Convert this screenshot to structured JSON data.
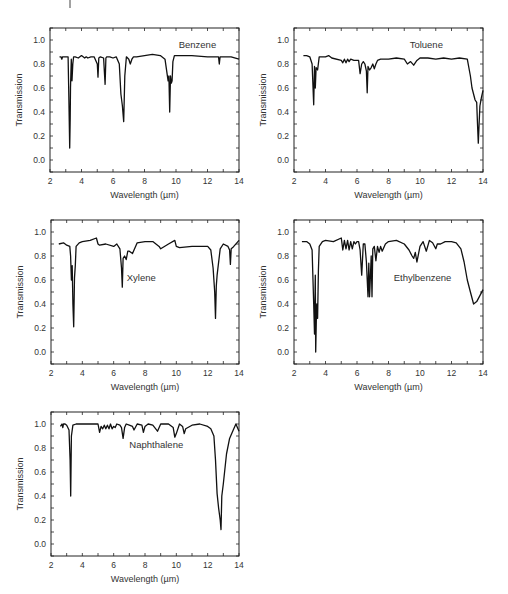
{
  "chart_data": [
    {
      "type": "line",
      "title": "Benzene",
      "xlabel": "Wavelength (µm)",
      "ylabel": "Transmission",
      "xlim": [
        2,
        14
      ],
      "ylim": [
        -0.1,
        1.1
      ],
      "xticks": [
        2,
        4,
        6,
        8,
        10,
        12,
        14
      ],
      "yticks": [
        "0.0",
        "0.2",
        "0.4",
        "0.6",
        "0.8",
        "1.0"
      ],
      "grid": false,
      "label_pos": [
        0.78,
        0.88
      ],
      "x": [
        2.6,
        2.7,
        2.75,
        2.8,
        3.0,
        3.15,
        3.2,
        3.25,
        3.28,
        3.3,
        3.35,
        3.4,
        3.45,
        3.5,
        3.6,
        3.8,
        4.0,
        4.2,
        4.3,
        4.4,
        4.6,
        4.8,
        5.0,
        5.05,
        5.1,
        5.2,
        5.4,
        5.5,
        5.55,
        5.6,
        5.8,
        6.0,
        6.2,
        6.4,
        6.5,
        6.6,
        6.68,
        6.75,
        6.85,
        7.0,
        7.1,
        7.2,
        7.3,
        7.5,
        8.0,
        8.5,
        9.0,
        9.3,
        9.5,
        9.55,
        9.6,
        9.65,
        9.7,
        9.75,
        9.8,
        9.9,
        10.0,
        10.5,
        11.0,
        12.0,
        12.7,
        12.75,
        12.8,
        12.85,
        13.0,
        13.5,
        14.0
      ],
      "y": [
        0.86,
        0.86,
        0.84,
        0.86,
        0.86,
        0.86,
        0.5,
        0.1,
        0.35,
        0.6,
        0.84,
        0.66,
        0.8,
        0.86,
        0.86,
        0.85,
        0.87,
        0.85,
        0.86,
        0.85,
        0.86,
        0.86,
        0.8,
        0.69,
        0.85,
        0.86,
        0.85,
        0.63,
        0.85,
        0.86,
        0.86,
        0.85,
        0.86,
        0.8,
        0.55,
        0.45,
        0.32,
        0.7,
        0.86,
        0.84,
        0.8,
        0.84,
        0.86,
        0.86,
        0.87,
        0.88,
        0.87,
        0.84,
        0.66,
        0.7,
        0.4,
        0.7,
        0.64,
        0.66,
        0.82,
        0.87,
        0.87,
        0.87,
        0.87,
        0.86,
        0.86,
        0.8,
        0.86,
        0.86,
        0.86,
        0.86,
        0.84
      ]
    },
    {
      "type": "line",
      "title": "Toluene",
      "xlabel": "Wavelength (µm)",
      "ylabel": "Transmission",
      "xlim": [
        2,
        14
      ],
      "ylim": [
        -0.1,
        1.1
      ],
      "xticks": [
        2,
        4,
        6,
        8,
        10,
        12,
        14
      ],
      "yticks": [
        "0.0",
        "0.2",
        "0.4",
        "0.6",
        "0.8",
        "1.0"
      ],
      "grid": false,
      "label_pos": [
        0.7,
        0.88
      ],
      "x": [
        2.6,
        2.8,
        3.0,
        3.15,
        3.25,
        3.3,
        3.35,
        3.4,
        3.5,
        3.6,
        4.0,
        4.2,
        4.4,
        5.0,
        5.1,
        5.2,
        5.3,
        5.4,
        5.5,
        5.6,
        5.8,
        6.0,
        6.1,
        6.2,
        6.3,
        6.4,
        6.5,
        6.6,
        6.65,
        6.7,
        6.8,
        6.9,
        7.0,
        7.1,
        7.2,
        7.3,
        7.5,
        8.0,
        8.5,
        9.0,
        9.2,
        9.4,
        9.6,
        9.8,
        10.0,
        10.5,
        11.0,
        11.5,
        12.0,
        12.5,
        13.0,
        13.2,
        13.3,
        13.5,
        13.6,
        13.65,
        13.7,
        13.75,
        13.8,
        13.9,
        14.0
      ],
      "y": [
        0.87,
        0.87,
        0.86,
        0.8,
        0.46,
        0.78,
        0.6,
        0.77,
        0.75,
        0.86,
        0.86,
        0.87,
        0.85,
        0.83,
        0.81,
        0.84,
        0.81,
        0.84,
        0.82,
        0.84,
        0.83,
        0.83,
        0.83,
        0.72,
        0.8,
        0.82,
        0.8,
        0.74,
        0.56,
        0.78,
        0.75,
        0.77,
        0.8,
        0.76,
        0.8,
        0.83,
        0.84,
        0.84,
        0.85,
        0.84,
        0.8,
        0.82,
        0.79,
        0.83,
        0.85,
        0.85,
        0.84,
        0.85,
        0.84,
        0.85,
        0.84,
        0.7,
        0.6,
        0.5,
        0.48,
        0.3,
        0.14,
        0.3,
        0.45,
        0.52,
        0.58
      ]
    },
    {
      "type": "line",
      "title": "Xylene",
      "xlabel": "Wavelength (µm)",
      "ylabel": "Transmission",
      "xlim": [
        2,
        14
      ],
      "ylim": [
        -0.1,
        1.1
      ],
      "xticks": [
        2,
        4,
        6,
        8,
        10,
        12,
        14
      ],
      "yticks": [
        "0.0",
        "0.2",
        "0.4",
        "0.6",
        "0.8",
        "1.0"
      ],
      "grid": false,
      "label_pos": [
        0.48,
        0.6
      ],
      "x": [
        2.5,
        2.8,
        3.0,
        3.2,
        3.25,
        3.3,
        3.35,
        3.4,
        3.45,
        3.5,
        3.55,
        3.6,
        3.8,
        4.0,
        4.5,
        4.9,
        5.0,
        5.1,
        5.5,
        6.0,
        6.2,
        6.4,
        6.5,
        6.55,
        6.6,
        6.7,
        6.8,
        6.9,
        7.0,
        7.2,
        7.5,
        8.0,
        8.5,
        8.9,
        9.0,
        9.5,
        9.9,
        10.0,
        10.2,
        11.0,
        12.0,
        12.2,
        12.35,
        12.45,
        12.5,
        12.55,
        12.6,
        12.8,
        13.0,
        13.3,
        13.4,
        13.45,
        13.5,
        13.6,
        14.0
      ],
      "y": [
        0.9,
        0.91,
        0.89,
        0.88,
        0.8,
        0.6,
        0.72,
        0.4,
        0.21,
        0.62,
        0.72,
        0.88,
        0.91,
        0.92,
        0.93,
        0.95,
        0.9,
        0.89,
        0.9,
        0.88,
        0.9,
        0.86,
        0.7,
        0.54,
        0.78,
        0.8,
        0.77,
        0.84,
        0.84,
        0.82,
        0.91,
        0.92,
        0.92,
        0.88,
        0.86,
        0.9,
        0.93,
        0.88,
        0.87,
        0.88,
        0.88,
        0.85,
        0.7,
        0.5,
        0.28,
        0.55,
        0.64,
        0.86,
        0.9,
        0.88,
        0.85,
        0.73,
        0.86,
        0.87,
        0.93
      ]
    },
    {
      "type": "line",
      "title": "Ethylbenzene",
      "xlabel": "Wavelength (µm)",
      "ylabel": "Transmission",
      "xlim": [
        2,
        14
      ],
      "ylim": [
        -0.1,
        1.1
      ],
      "xticks": [
        2,
        4,
        6,
        8,
        10,
        12,
        14
      ],
      "yticks": [
        "0.0",
        "0.2",
        "0.4",
        "0.6",
        "0.8",
        "1.0"
      ],
      "grid": false,
      "label_pos": [
        0.68,
        0.6
      ],
      "x": [
        2.5,
        2.8,
        3.0,
        3.15,
        3.25,
        3.3,
        3.35,
        3.38,
        3.42,
        3.45,
        3.5,
        3.55,
        3.6,
        3.8,
        4.0,
        4.5,
        5.0,
        5.1,
        5.2,
        5.3,
        5.4,
        5.5,
        5.6,
        5.7,
        5.8,
        5.9,
        6.0,
        6.1,
        6.2,
        6.3,
        6.4,
        6.5,
        6.6,
        6.7,
        6.75,
        6.8,
        6.9,
        6.95,
        7.0,
        7.1,
        7.2,
        7.3,
        7.4,
        7.5,
        7.6,
        7.8,
        8.0,
        8.5,
        9.0,
        9.3,
        9.5,
        9.6,
        9.7,
        9.8,
        10.0,
        10.2,
        10.4,
        10.6,
        10.8,
        11.0,
        11.1,
        11.3,
        11.6,
        12.0,
        12.3,
        12.6,
        12.8,
        13.0,
        13.2,
        13.4,
        13.6,
        13.8,
        14.0
      ],
      "y": [
        0.92,
        0.92,
        0.9,
        0.85,
        0.4,
        0.15,
        0.64,
        0.0,
        0.3,
        0.4,
        0.28,
        0.68,
        0.88,
        0.92,
        0.93,
        0.92,
        0.95,
        0.85,
        0.93,
        0.86,
        0.93,
        0.85,
        0.92,
        0.86,
        0.92,
        0.9,
        0.92,
        0.92,
        0.85,
        0.64,
        0.9,
        0.9,
        0.75,
        0.46,
        0.74,
        0.46,
        0.8,
        0.46,
        0.86,
        0.88,
        0.76,
        0.88,
        0.83,
        0.88,
        0.84,
        0.9,
        0.92,
        0.93,
        0.9,
        0.85,
        0.8,
        0.78,
        0.83,
        0.75,
        0.88,
        0.92,
        0.84,
        0.93,
        0.91,
        0.86,
        0.9,
        0.9,
        0.92,
        0.92,
        0.91,
        0.86,
        0.75,
        0.6,
        0.5,
        0.4,
        0.42,
        0.47,
        0.52
      ]
    },
    {
      "type": "line",
      "title": "Naphthalene",
      "xlabel": "Wavelength (µm)",
      "ylabel": "Transmission",
      "xlim": [
        2,
        14
      ],
      "ylim": [
        -0.1,
        1.1
      ],
      "xticks": [
        2,
        4,
        6,
        8,
        10,
        12,
        14
      ],
      "yticks": [
        "0.0",
        "0.2",
        "0.4",
        "0.6",
        "0.8",
        "1.0"
      ],
      "grid": false,
      "label_pos": [
        0.56,
        0.77
      ],
      "x": [
        2.6,
        2.7,
        2.75,
        2.8,
        2.9,
        3.0,
        3.15,
        3.22,
        3.26,
        3.3,
        3.4,
        3.6,
        4.0,
        4.5,
        5.0,
        5.1,
        5.2,
        5.3,
        5.4,
        5.5,
        5.6,
        5.7,
        5.8,
        5.9,
        6.0,
        6.1,
        6.2,
        6.4,
        6.5,
        6.6,
        6.7,
        6.8,
        7.0,
        7.2,
        7.3,
        7.5,
        7.8,
        7.9,
        8.0,
        8.2,
        8.5,
        8.8,
        9.0,
        9.5,
        9.8,
        9.9,
        10.0,
        10.2,
        10.4,
        10.5,
        10.6,
        11.0,
        11.5,
        12.0,
        12.2,
        12.4,
        12.5,
        12.6,
        12.7,
        12.8,
        12.85,
        12.9,
        13.0,
        13.2,
        13.4,
        13.6,
        13.8,
        14.0
      ],
      "y": [
        0.98,
        1.0,
        0.97,
        1.0,
        1.0,
        0.99,
        0.95,
        0.7,
        0.4,
        0.9,
        0.99,
        1.0,
        1.0,
        1.0,
        1.0,
        0.93,
        0.98,
        0.96,
        0.99,
        0.96,
        0.99,
        0.96,
        1.0,
        0.96,
        0.98,
        0.97,
        1.0,
        0.99,
        0.97,
        0.88,
        0.97,
        1.0,
        0.99,
        0.98,
        0.95,
        1.0,
        0.99,
        0.93,
        0.98,
        1.0,
        0.99,
        0.94,
        1.0,
        1.0,
        0.97,
        0.89,
        0.92,
        1.0,
        0.98,
        0.92,
        0.96,
        0.99,
        1.0,
        0.98,
        0.96,
        0.9,
        0.7,
        0.42,
        0.3,
        0.2,
        0.12,
        0.4,
        0.5,
        0.75,
        0.88,
        0.94,
        1.0,
        0.94
      ]
    }
  ],
  "panels": {
    "benzene": {
      "title": "Benzene"
    },
    "toluene": {
      "title": "Toluene"
    },
    "xylene": {
      "title": "Xylene"
    },
    "ethylbenzene": {
      "title": "Ethylbenzene"
    },
    "naphthalene": {
      "title": "Naphthalene"
    }
  },
  "axes": {
    "xlabel": "Wavelength (µm)",
    "ylabel": "Transmission"
  },
  "colors": {
    "line": "#111111",
    "frame": "#222222",
    "text": "#333333"
  }
}
